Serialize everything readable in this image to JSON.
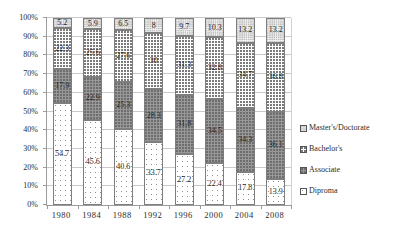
{
  "chart_data": {
    "type": "bar",
    "variant": "stacked-100-percent",
    "title": "",
    "categories": [
      "1980",
      "1984",
      "1988",
      "1992",
      "1996",
      "2000",
      "2004",
      "2008"
    ],
    "series": [
      {
        "name": "Diproma",
        "pattern": "diproma",
        "values": [
          54.7,
          45.6,
          40.6,
          33.7,
          27.2,
          22.4,
          17.8,
          13.9
        ]
      },
      {
        "name": "Associate",
        "pattern": "associate",
        "values": [
          17.9,
          22.9,
          25.3,
          28.3,
          31.8,
          34.5,
          34.3,
          36.1
        ]
      },
      {
        "name": "Bachelor's",
        "pattern": "bachelors",
        "values": [
          22.3,
          25.6,
          27.6,
          30,
          31.3,
          32.8,
          34.7,
          36.8
        ]
      },
      {
        "name": "Master's/Doctorate",
        "pattern": "masters",
        "values": [
          5.2,
          5.9,
          6.5,
          8,
          9.7,
          10.3,
          13.2,
          13.2
        ]
      }
    ],
    "stack_order": "bottom-to-top",
    "y_axis": {
      "min": 0,
      "max": 100,
      "ticks": [
        "0%",
        "10%",
        "20%",
        "30%",
        "40%",
        "50%",
        "60%",
        "70%",
        "80%",
        "90%",
        "100%"
      ]
    },
    "grid": true,
    "legend": {
      "position": "right",
      "items": [
        "Master's/Doctorate",
        "Bachelor's",
        "Associate",
        "Diproma"
      ]
    }
  },
  "colors": {
    "background": "#ffffff",
    "grid_line": "#c9c9c9",
    "axis_line": "#9b9b9b",
    "segment_border": "#7e7e7e",
    "associate_fill": "#989898",
    "dot_pattern": "#8f8f8f",
    "label_text": "#1f1f1f"
  }
}
